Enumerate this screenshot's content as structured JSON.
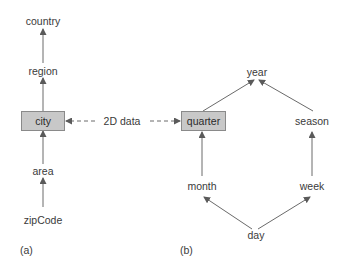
{
  "diagram": {
    "a": {
      "caption": "(a)",
      "nodes": {
        "country": "country",
        "region": "region",
        "city": "city",
        "area": "area",
        "zipCode": "zipCode"
      }
    },
    "b": {
      "caption": "(b)",
      "nodes": {
        "year": "year",
        "quarter": "quarter",
        "season": "season",
        "month": "month",
        "week": "week",
        "day": "day"
      }
    },
    "link_label": "2D data",
    "colors": {
      "box_fill": "#c8c8c8",
      "box_border": "#8a8a8a",
      "line": "#6a6a6a",
      "text": "#3a3a3a"
    }
  }
}
